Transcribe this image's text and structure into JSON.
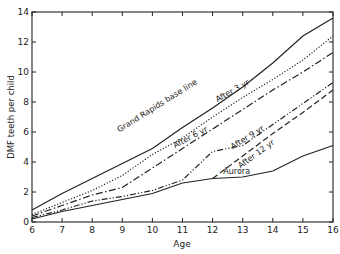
{
  "chart_data": {
    "type": "line",
    "title": "",
    "xlabel": "Age",
    "ylabel": "DMF teeth per child",
    "xlim": [
      6,
      16
    ],
    "ylim": [
      0,
      14
    ],
    "x_ticks": [
      6,
      7,
      8,
      9,
      10,
      11,
      12,
      13,
      14,
      15,
      16
    ],
    "y_ticks": [
      0,
      2,
      4,
      6,
      8,
      10,
      12,
      14
    ],
    "grid": false,
    "legend": "inline labels on lines",
    "series": [
      {
        "name": "Grand Rapids base line",
        "style": "solid",
        "x": [
          6,
          7,
          8,
          9,
          10,
          11,
          12,
          13,
          14,
          15,
          16
        ],
        "y": [
          0.8,
          1.9,
          2.9,
          3.9,
          4.9,
          6.3,
          7.6,
          9.0,
          10.6,
          12.4,
          13.6
        ]
      },
      {
        "name": "After 3 yr",
        "style": "dotted",
        "x": [
          6,
          7,
          8,
          9,
          10,
          11,
          12,
          13,
          14,
          15,
          16
        ],
        "y": [
          0.5,
          1.3,
          2.1,
          3.1,
          4.5,
          5.6,
          7.0,
          8.3,
          9.5,
          10.8,
          12.4
        ]
      },
      {
        "name": "After 6 yr",
        "style": "dash-dot",
        "x": [
          6,
          7,
          8,
          9,
          10,
          11,
          12,
          13,
          14,
          15,
          16
        ],
        "y": [
          0.4,
          1.1,
          1.8,
          2.3,
          3.6,
          4.9,
          6.2,
          7.5,
          8.8,
          10.0,
          11.3
        ]
      },
      {
        "name": "After 9 yr",
        "style": "dash-dot-dot",
        "x": [
          6,
          7,
          8,
          9,
          10,
          11,
          12,
          13,
          14,
          15,
          16
        ],
        "y": [
          0.3,
          0.8,
          1.4,
          1.7,
          2.1,
          2.8,
          4.7,
          5.1,
          6.5,
          7.9,
          9.3
        ]
      },
      {
        "name": "After 12 yr",
        "style": "dashed",
        "x": [
          12,
          13,
          14,
          15,
          16
        ],
        "y": [
          2.9,
          4.4,
          5.9,
          7.3,
          8.8
        ]
      },
      {
        "name": "Aurora",
        "style": "solid",
        "x": [
          6,
          7,
          8,
          9,
          10,
          11,
          12,
          13,
          14,
          15,
          16
        ],
        "y": [
          0.2,
          0.7,
          1.1,
          1.5,
          1.9,
          2.6,
          2.9,
          3.0,
          3.4,
          4.4,
          5.1
        ]
      }
    ],
    "annotations": [
      {
        "text": "Grand Rapids base line",
        "x": 10.2,
        "y": 7.6,
        "angle": -32
      },
      {
        "text": "After 3 yr",
        "x": 12.7,
        "y": 8.6,
        "angle": -30
      },
      {
        "text": "After 6 yr",
        "x": 11.3,
        "y": 5.5,
        "angle": -28
      },
      {
        "text": "After 9 yr",
        "x": 13.2,
        "y": 5.5,
        "angle": -32
      },
      {
        "text": "After 12 yr",
        "x": 13.5,
        "y": 4.4,
        "angle": -36
      },
      {
        "text": "Aurora",
        "x": 12.8,
        "y": 3.2,
        "angle": 0
      }
    ]
  }
}
